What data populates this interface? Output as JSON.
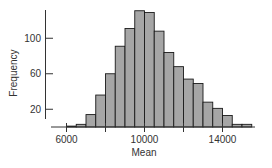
{
  "chart_data": {
    "type": "bar",
    "subtype": "histogram",
    "title": "",
    "xlabel": "Mean",
    "ylabel": "Frequency",
    "bin_width": 500,
    "bin_edges": [
      6000,
      6500,
      7000,
      7500,
      8000,
      8500,
      9000,
      9500,
      10000,
      10500,
      11000,
      11500,
      12000,
      12500,
      13000,
      13500,
      14000,
      14500,
      15000,
      15500
    ],
    "categories": [
      "6000-6500",
      "6500-7000",
      "7000-7500",
      "7500-8000",
      "8000-8500",
      "8500-9000",
      "9000-9500",
      "9500-10000",
      "10000-10500",
      "10500-11000",
      "11000-11500",
      "11500-12000",
      "12000-12500",
      "12500-13000",
      "13000-13500",
      "13500-14000",
      "14000-14500",
      "14500-15000",
      "15000-15500"
    ],
    "values": [
      1,
      3,
      14,
      36,
      60,
      91,
      111,
      131,
      129,
      108,
      84,
      68,
      54,
      49,
      28,
      21,
      13,
      3,
      3
    ],
    "x_ticks": [
      6000,
      8000,
      10000,
      12000,
      14000
    ],
    "x_tick_labels": [
      "6000",
      "",
      "10000",
      "",
      "14000"
    ],
    "y_ticks": [
      20,
      60,
      100
    ],
    "y_tick_labels": [
      "20",
      "60",
      "100"
    ],
    "xlim": [
      5000,
      16000
    ],
    "ylim": [
      0,
      135
    ],
    "grid": false,
    "legend": null,
    "colors": {
      "bar_fill": "#a6a6a6",
      "bar_edge": "#1a1a1a",
      "axis": "#333333"
    }
  }
}
